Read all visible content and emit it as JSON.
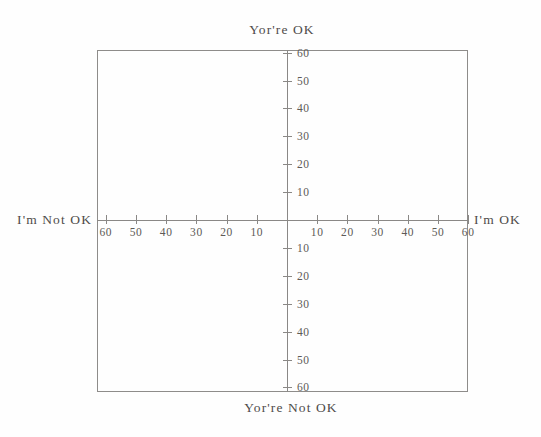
{
  "chart_data": {
    "type": "scatter",
    "title": "",
    "subtitle": "",
    "xlabel": "",
    "ylabel": "",
    "xlim": [
      -65,
      65
    ],
    "ylim": [
      -65,
      65
    ],
    "grid": false,
    "legend": null,
    "series": [],
    "x_ticks_left": [
      60,
      50,
      40,
      30,
      20,
      10
    ],
    "x_ticks_right": [
      10,
      20,
      30,
      40,
      50,
      60
    ],
    "y_ticks_up": [
      60,
      50,
      40,
      30,
      20,
      10
    ],
    "y_ticks_down": [
      10,
      20,
      30,
      40,
      50,
      60
    ],
    "tick_step": 10,
    "tick_max": 60,
    "annotations": {
      "top": "Yor're OK",
      "bottom": "Yor're Not OK",
      "left": "I'm Not OK",
      "right": "I'm OK"
    },
    "colors": {
      "axis": "#8a8886",
      "frame": "#8e8c8a",
      "text": "#4f4c4a",
      "background": "#fefefe"
    }
  },
  "captions": {
    "top": "Yor're OK",
    "bottom": "Yor're Not OK",
    "left": "I'm Not OK",
    "right": "I'm OK"
  }
}
